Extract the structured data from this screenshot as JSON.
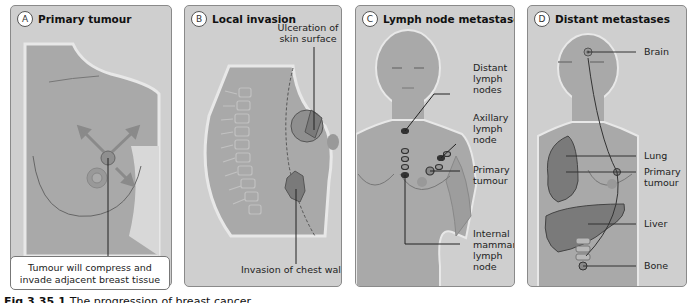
{
  "figure": {
    "caption_label": "Fig 3.35.1",
    "caption_text": "The progression of breast cancer"
  },
  "panels": [
    {
      "letter": "A",
      "title": "Primary tumour",
      "callout": "Tumour will compress and invade adjacent breast tissue",
      "labels": []
    },
    {
      "letter": "B",
      "title": "Local invasion",
      "labels": [
        {
          "text": "Ulceration of skin surface"
        },
        {
          "text": "Invasion of chest wall"
        }
      ]
    },
    {
      "letter": "C",
      "title": "Lymph node metastases",
      "labels": [
        {
          "text": "Distant lymph nodes"
        },
        {
          "text": "Axillary lymph node"
        },
        {
          "text": "Primary tumour"
        },
        {
          "text": "Internal mammary lymph node"
        }
      ]
    },
    {
      "letter": "D",
      "title": "Distant metastases",
      "labels": [
        {
          "text": "Brain"
        },
        {
          "text": "Lung"
        },
        {
          "text": "Primary tumour"
        },
        {
          "text": "Liver"
        },
        {
          "text": "Bone"
        }
      ]
    }
  ],
  "colors": {
    "panel_bg": "#cfcfcf",
    "body_fill": "#a9a9a9",
    "organ_fill": "#7a7a7a",
    "tumour_fill": "#8f8f8f",
    "line": "#333333"
  }
}
